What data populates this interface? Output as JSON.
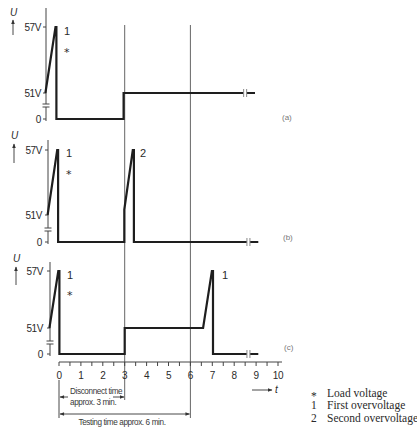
{
  "figure": {
    "y_axis_label": "U",
    "x_axis_label": "t",
    "y_ticks": {
      "high": "57V",
      "mid": "51V",
      "zero": "0"
    },
    "x_ticks": [
      "0",
      "1",
      "2",
      "3",
      "4",
      "5",
      "6",
      "7",
      "8",
      "9",
      "10"
    ],
    "panels": {
      "a": {
        "label": "(a)",
        "peak_label": "1",
        "load_marker": "*"
      },
      "b": {
        "label": "(b)",
        "peak_label": "1",
        "load_marker": "*",
        "second_peak_label": "2"
      },
      "c": {
        "label": "(c)",
        "peak_label": "1",
        "load_marker": "*",
        "second_peak_label": "1"
      }
    },
    "dimensions": {
      "disconnect_line1": "Disconnect time",
      "disconnect_line2": "approx. 3 min.",
      "testing": "Testing time approx. 6 min."
    },
    "legend": [
      {
        "symbol": "*",
        "text": "Load voltage"
      },
      {
        "symbol": "1",
        "text": "First overvoltage"
      },
      {
        "symbol": "2",
        "text": "Second overvoltage"
      }
    ]
  },
  "chart_data": {
    "type": "line",
    "title": "",
    "xlabel": "t",
    "ylabel": "U",
    "x_unit": "min",
    "xlim": [
      0,
      10
    ],
    "x_ticks": [
      0,
      1,
      2,
      3,
      4,
      5,
      6,
      7,
      8,
      9,
      10
    ],
    "y_ticks": [
      "0",
      "51V",
      "57V"
    ],
    "y_axis_broken_between": [
      0,
      51
    ],
    "reference_lines_t": [
      3,
      6
    ],
    "series": [
      {
        "name": "(a)",
        "break_t": 8.5,
        "points": [
          [
            -0.62,
            51
          ],
          [
            -0.16,
            57
          ],
          [
            -0.12,
            57
          ],
          [
            -0.12,
            0
          ],
          [
            2.95,
            0
          ],
          [
            2.95,
            51
          ],
          [
            8.95,
            51
          ]
        ]
      },
      {
        "name": "(b)",
        "break_t": 8.65,
        "points": [
          [
            -0.52,
            51
          ],
          [
            -0.08,
            57
          ],
          [
            -0.04,
            57
          ],
          [
            -0.04,
            0
          ],
          [
            2.98,
            0
          ],
          [
            2.98,
            51.5
          ],
          [
            3.37,
            57
          ],
          [
            3.42,
            57
          ],
          [
            3.42,
            0
          ],
          [
            9.1,
            0
          ]
        ]
      },
      {
        "name": "(c)",
        "break_t": 8.65,
        "points": [
          [
            -0.44,
            51
          ],
          [
            -0.03,
            57
          ],
          [
            0.02,
            57
          ],
          [
            0.02,
            0
          ],
          [
            3.0,
            0
          ],
          [
            3.0,
            51
          ],
          [
            6.58,
            51
          ],
          [
            6.98,
            57
          ],
          [
            7.03,
            57
          ],
          [
            7.03,
            0
          ],
          [
            9.1,
            0
          ]
        ]
      }
    ],
    "annotations": [
      {
        "panel": "(a)",
        "text": "1",
        "meaning": "First overvoltage"
      },
      {
        "panel": "(a)",
        "text": "*",
        "meaning": "Load voltage"
      },
      {
        "panel": "(b)",
        "text": "1",
        "meaning": "First overvoltage"
      },
      {
        "panel": "(b)",
        "text": "2",
        "meaning": "Second overvoltage"
      },
      {
        "panel": "(c)",
        "text": "1",
        "meaning": "First overvoltage"
      },
      {
        "panel": "(c)",
        "text": "1",
        "meaning": "Overvoltage after testing time"
      }
    ],
    "dimension_annotations": [
      {
        "from_t": 0,
        "to_t": 3,
        "text": "Disconnect time approx. 3 min."
      },
      {
        "from_t": 0,
        "to_t": 6,
        "text": "Testing time approx. 6 min."
      }
    ]
  }
}
